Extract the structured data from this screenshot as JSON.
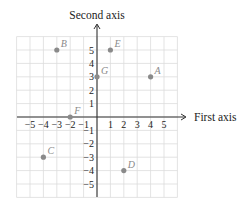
{
  "diagram": {
    "type": "coordinate-plane",
    "x_axis_title": "First axis",
    "y_axis_title": "Second axis",
    "x_range": [
      -6,
      6
    ],
    "y_range": [
      -6,
      6
    ],
    "x_ticks": [
      "−5",
      "−4",
      "−3",
      "−2",
      "−1",
      "1",
      "2",
      "3",
      "4",
      "5"
    ],
    "y_ticks": [
      "5",
      "4",
      "3",
      "2",
      "1",
      "−1",
      "−2",
      "−3",
      "−4",
      "−5"
    ],
    "point_color": "#8a8a8a",
    "axis_color": "#333333",
    "grid_color": "#dcdcdc",
    "points": [
      {
        "label": "A",
        "x": 4,
        "y": 3
      },
      {
        "label": "B",
        "x": -3,
        "y": 5
      },
      {
        "label": "C",
        "x": -4,
        "y": -3
      },
      {
        "label": "D",
        "x": 2,
        "y": -4
      },
      {
        "label": "E",
        "x": 1,
        "y": 5
      },
      {
        "label": "F",
        "x": -2,
        "y": 0
      },
      {
        "label": "G",
        "x": 0,
        "y": 3
      }
    ]
  }
}
